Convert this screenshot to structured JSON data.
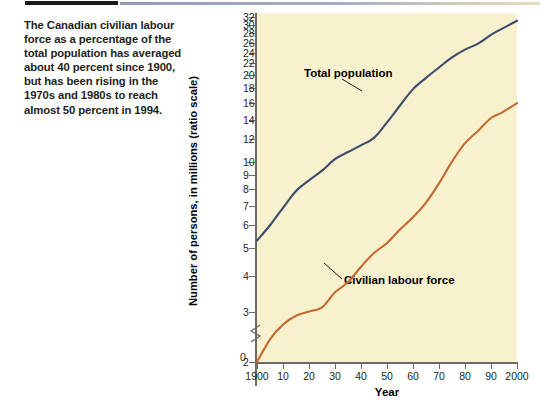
{
  "caption": {
    "text": "The Canadian civilian labour force as a percentage of the total population has averaged about 40 percent since 1900, but has been rising in the 1970s and 1980s to reach almost 50 percent in 1994."
  },
  "chart_data": {
    "type": "line",
    "title": "",
    "xlabel": "Year",
    "ylabel": "Number of persons, in millions (ratio scale)",
    "yscale": "log",
    "ylim": [
      2,
      33
    ],
    "xlim": [
      1900,
      2000
    ],
    "grid": false,
    "legend_position": "inline-annotation",
    "zero_label": "0",
    "axis_break": true,
    "ytick_labels": [
      "32",
      "30",
      "28",
      "26",
      "24",
      "22",
      "20",
      "18",
      "16",
      "14",
      "12",
      "10",
      "9",
      "8",
      "7",
      "6",
      "5",
      "4",
      "3",
      "2"
    ],
    "ytick_values": [
      32,
      30,
      28,
      26,
      24,
      22,
      20,
      18,
      16,
      14,
      12,
      10,
      9,
      8,
      7,
      6,
      5,
      4,
      3,
      2
    ],
    "xtick_labels": [
      "1900",
      "10",
      "20",
      "30",
      "40",
      "50",
      "60",
      "70",
      "80",
      "90",
      "2000"
    ],
    "xtick_values": [
      1900,
      1910,
      1920,
      1930,
      1940,
      1950,
      1960,
      1970,
      1980,
      1990,
      2000
    ],
    "x": [
      1900,
      1905,
      1910,
      1915,
      1920,
      1925,
      1930,
      1935,
      1940,
      1945,
      1950,
      1955,
      1960,
      1965,
      1970,
      1975,
      1980,
      1985,
      1990,
      1994,
      2000
    ],
    "series": [
      {
        "name": "Total population",
        "color": "#3d4c6d",
        "values": [
          5.3,
          6.0,
          6.9,
          7.9,
          8.6,
          9.3,
          10.2,
          10.8,
          11.4,
          12.1,
          13.7,
          15.7,
          17.9,
          19.6,
          21.3,
          23.1,
          24.6,
          25.8,
          27.7,
          29.0,
          31.0
        ]
      },
      {
        "name": "Civilian labour force",
        "color": "#c4692f",
        "values": [
          2.0,
          2.4,
          2.7,
          2.9,
          3.0,
          3.1,
          3.5,
          3.8,
          4.3,
          4.8,
          5.2,
          5.8,
          6.4,
          7.2,
          8.4,
          10.0,
          11.6,
          12.8,
          14.2,
          14.8,
          16.0
        ]
      }
    ],
    "annotations": [
      {
        "label": "Total population",
        "x_px": 108,
        "y_px": 61
      },
      {
        "label": "Civilian labour force",
        "x_px": 148,
        "y_px": 268
      }
    ]
  }
}
